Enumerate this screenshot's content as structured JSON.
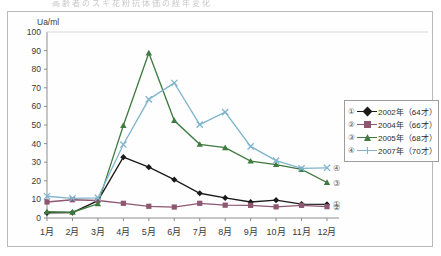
{
  "scan": {
    "header_ghost_text": "高齢者のスギ花粉抗体価の経年変化"
  },
  "legend": {
    "position": "right",
    "items": [
      {
        "number": "①",
        "label": "2002年（64才）",
        "color": "#1b1b1b",
        "marker": "diamond"
      },
      {
        "number": "②",
        "label": "2004年（66才）",
        "color": "#8e5670",
        "marker": "square"
      },
      {
        "number": "③",
        "label": "2005年（68才）",
        "color": "#3f7a3f",
        "marker": "triangle"
      },
      {
        "number": "④",
        "label": "2007年（70才）",
        "color": "#7fb4cc",
        "marker": "cross"
      }
    ]
  },
  "end_labels": [
    {
      "number": "④",
      "value": 27
    },
    {
      "number": "③",
      "value": 19
    },
    {
      "number": "①",
      "value": 7.3
    },
    {
      "number": "②",
      "value": 6.1
    }
  ],
  "chart_data": {
    "type": "line",
    "title": "",
    "xlabel": "",
    "ylabel": "Ua/ml",
    "ylim": [
      0,
      100
    ],
    "ytick_step": 10,
    "yticks": [
      0,
      10,
      20,
      30,
      40,
      50,
      60,
      70,
      80,
      90,
      100
    ],
    "grid": false,
    "legend_position": "right",
    "categories": [
      "1月",
      "2月",
      "3月",
      "4月",
      "5月",
      "6月",
      "7月",
      "8月",
      "9月",
      "10月",
      "11月",
      "12月"
    ],
    "series": [
      {
        "name": "2002年（64才）",
        "number": "①",
        "color": "#1b1b1b",
        "marker": "diamond",
        "values": [
          2.8,
          2.9,
          9.3,
          32.7,
          27.3,
          20.6,
          13.3,
          10.8,
          8.6,
          9.6,
          7.5,
          7.3
        ]
      },
      {
        "name": "2004年（66才）",
        "number": "②",
        "color": "#8e5670",
        "marker": "square",
        "values": [
          8.6,
          9.8,
          9.4,
          7.9,
          6.3,
          5.9,
          7.9,
          6.9,
          6.8,
          6.0,
          6.8,
          6.1
        ]
      },
      {
        "name": "2005年（68才）",
        "number": "③",
        "color": "#3f7a3f",
        "marker": "triangle",
        "values": [
          3.4,
          3.1,
          7.6,
          49.7,
          88.7,
          52.4,
          39.6,
          37.8,
          30.6,
          28.7,
          26.1,
          19.1
        ]
      },
      {
        "name": "2007年（70才）",
        "number": "④",
        "color": "#7fb4cc",
        "marker": "cross",
        "values": [
          11.7,
          10.6,
          10.8,
          39.5,
          63.8,
          72.6,
          50.2,
          56.9,
          38.5,
          30.9,
          26.7,
          27.0
        ]
      }
    ]
  }
}
